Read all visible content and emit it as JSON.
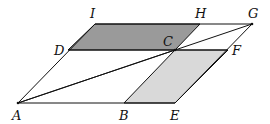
{
  "diagram": {
    "type": "geometry",
    "colors": {
      "dark_fill": "#9a9a9a",
      "light_fill": "#d9d9d9",
      "stroke": "#111111"
    },
    "points": {
      "A": {
        "label": "A",
        "x": 18,
        "y": 103
      },
      "B": {
        "label": "B",
        "x": 124,
        "y": 103
      },
      "E": {
        "label": "E",
        "x": 175,
        "y": 103
      },
      "F": {
        "label": "F",
        "x": 228,
        "y": 50
      },
      "C": {
        "label": "C",
        "x": 175,
        "y": 50
      },
      "D": {
        "label": "D",
        "x": 68,
        "y": 50
      },
      "I": {
        "label": "I",
        "x": 95,
        "y": 24
      },
      "H": {
        "label": "H",
        "x": 200,
        "y": 24
      },
      "G": {
        "label": "G",
        "x": 252,
        "y": 24
      }
    },
    "shaded_regions": [
      {
        "name": "DCHI",
        "shade": "dark"
      },
      {
        "name": "BEFC",
        "shade": "light"
      }
    ]
  }
}
